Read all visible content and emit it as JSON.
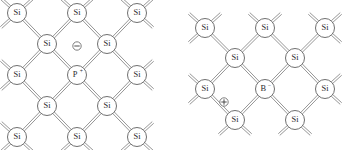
{
  "figure": {
    "background_color": "#ffffff",
    "bond_color": "#8a8a8a",
    "atom_outline_color": "#6f6f6f",
    "atom_fill_color": "#ffffff",
    "label_color": "#2b2b2b",
    "bond_style": "double-parallel-line",
    "bond_gap_px": 2.2,
    "atom_radius_px": 9.5,
    "charge_radius_px": 4.2
  },
  "diagrams": [
    {
      "id": "n-type",
      "name": "phosphorus-doped-silicon",
      "doping_type": "n-type",
      "dopant_label": "P",
      "dopant_superscript": "+",
      "carrier_symbol": "minus",
      "carrier_name": "free-electron",
      "grid_origin_x": 17,
      "grid_origin_y": 13,
      "grid_step_x": 34,
      "grid_step_y": 31,
      "atoms": [
        {
          "label": "Si",
          "sup": "",
          "col": 0,
          "row": 0,
          "x": 17,
          "y": 13
        },
        {
          "label": "Si",
          "sup": "",
          "col": 2,
          "row": 0,
          "x": 77,
          "y": 13
        },
        {
          "label": "Si",
          "sup": "",
          "col": 4,
          "row": 0,
          "x": 137,
          "y": 13
        },
        {
          "label": "Si",
          "sup": "",
          "col": 1,
          "row": 1,
          "x": 47,
          "y": 44
        },
        {
          "label": "Si",
          "sup": "",
          "col": 3,
          "row": 1,
          "x": 107,
          "y": 44
        },
        {
          "label": "Si",
          "sup": "",
          "col": 0,
          "row": 2,
          "x": 17,
          "y": 75
        },
        {
          "label": "P",
          "sup": "+",
          "col": 2,
          "row": 2,
          "x": 77,
          "y": 75
        },
        {
          "label": "Si",
          "sup": "",
          "col": 4,
          "row": 2,
          "x": 137,
          "y": 75
        },
        {
          "label": "Si",
          "sup": "",
          "col": 1,
          "row": 3,
          "x": 47,
          "y": 106
        },
        {
          "label": "Si",
          "sup": "",
          "col": 3,
          "row": 3,
          "x": 107,
          "y": 106
        },
        {
          "label": "Si",
          "sup": "",
          "col": 0,
          "row": 4,
          "x": 17,
          "y": 137
        },
        {
          "label": "Si",
          "sup": "",
          "col": 2,
          "row": 4,
          "x": 77,
          "y": 137
        },
        {
          "label": "Si",
          "sup": "",
          "col": 4,
          "row": 4,
          "x": 137,
          "y": 137
        }
      ],
      "charge": {
        "symbol": "⊖",
        "sign": "-",
        "x": 77,
        "y": 46
      }
    },
    {
      "id": "p-type",
      "name": "boron-doped-silicon",
      "doping_type": "p-type",
      "dopant_label": "B",
      "dopant_superscript": "−",
      "carrier_symbol": "plus",
      "carrier_name": "hole",
      "grid_origin_x": 205,
      "grid_origin_y": 28,
      "grid_step_x": 34,
      "grid_step_y": 31,
      "atoms": [
        {
          "label": "Si",
          "sup": "",
          "col": 0,
          "row": 0,
          "x": 205,
          "y": 28
        },
        {
          "label": "Si",
          "sup": "",
          "col": 2,
          "row": 0,
          "x": 265,
          "y": 28
        },
        {
          "label": "Si",
          "sup": "",
          "col": 4,
          "row": 0,
          "x": 325,
          "y": 28
        },
        {
          "label": "Si",
          "sup": "",
          "col": 1,
          "row": 1,
          "x": 235,
          "y": 58
        },
        {
          "label": "Si",
          "sup": "",
          "col": 3,
          "row": 1,
          "x": 295,
          "y": 58
        },
        {
          "label": "Si",
          "sup": "",
          "col": 0,
          "row": 2,
          "x": 205,
          "y": 89
        },
        {
          "label": "B",
          "sup": "−",
          "col": 2,
          "row": 2,
          "x": 265,
          "y": 89
        },
        {
          "label": "Si",
          "sup": "",
          "col": 4,
          "row": 2,
          "x": 325,
          "y": 89
        },
        {
          "label": "Si",
          "sup": "",
          "col": 1,
          "row": 3,
          "x": 235,
          "y": 120
        },
        {
          "label": "Si",
          "sup": "",
          "col": 3,
          "row": 3,
          "x": 295,
          "y": 120
        }
      ],
      "charge": {
        "symbol": "⊕",
        "sign": "+",
        "x": 224,
        "y": 102
      }
    }
  ]
}
